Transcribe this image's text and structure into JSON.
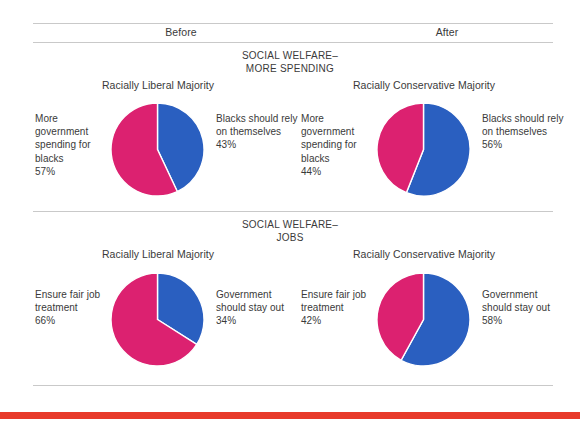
{
  "page": {
    "column_headers": {
      "before": "Before",
      "after": "After"
    },
    "accent_colors": {
      "magenta": "#dc2170",
      "blue": "#2a5fc0",
      "rule": "#c9c9c9",
      "bottom_bar": "#e83a2a",
      "text": "#3a3a3a"
    },
    "bottom_bar_label": "decorative-red-bar"
  },
  "sections": [
    {
      "title_line1": "SOCIAL WELFARE–",
      "title_line2": "MORE SPENDING",
      "panels": [
        {
          "heading": "Racially Liberal Majority",
          "left_label": "More government spending for blacks",
          "left_pct": "57%",
          "right_label": "Blacks should rely on themselves",
          "right_pct": "43%"
        },
        {
          "heading": "Racially Conservative Majority",
          "left_label": "More government spending for blacks",
          "left_pct": "44%",
          "right_label": "Blacks should rely on themselves",
          "right_pct": "56%"
        }
      ]
    },
    {
      "title_line1": "SOCIAL WELFARE–",
      "title_line2": "JOBS",
      "panels": [
        {
          "heading": "Racially Liberal Majority",
          "left_label": "Ensure fair job treatment",
          "left_pct": "66%",
          "right_label": "Government should stay out",
          "right_pct": "34%"
        },
        {
          "heading": "Racially Conservative Majority",
          "left_label": "Ensure fair job treatment",
          "left_pct": "42%",
          "right_label": "Government should stay out",
          "right_pct": "58%"
        }
      ]
    }
  ],
  "chart_data": [
    {
      "type": "pie",
      "title": "SOCIAL WELFARE–MORE SPENDING — Before — Racially Liberal Majority",
      "categories": [
        "More government spending for blacks",
        "Blacks should rely on themselves"
      ],
      "values": [
        57,
        43
      ],
      "colors": [
        "#dc2170",
        "#2a5fc0"
      ],
      "start_angle_deg": 0,
      "direction": "clockwise",
      "legend": "side-labels"
    },
    {
      "type": "pie",
      "title": "SOCIAL WELFARE–MORE SPENDING — After — Racially Conservative Majority",
      "categories": [
        "More government spending for blacks",
        "Blacks should rely on themselves"
      ],
      "values": [
        44,
        56
      ],
      "colors": [
        "#dc2170",
        "#2a5fc0"
      ],
      "start_angle_deg": 0,
      "direction": "clockwise",
      "legend": "side-labels"
    },
    {
      "type": "pie",
      "title": "SOCIAL WELFARE–JOBS — Before — Racially Liberal Majority",
      "categories": [
        "Ensure fair job treatment",
        "Government should stay out"
      ],
      "values": [
        66,
        34
      ],
      "colors": [
        "#dc2170",
        "#2a5fc0"
      ],
      "start_angle_deg": 0,
      "direction": "clockwise",
      "legend": "side-labels"
    },
    {
      "type": "pie",
      "title": "SOCIAL WELFARE–JOBS — After — Racially Conservative Majority",
      "categories": [
        "Ensure fair job treatment",
        "Government should stay out"
      ],
      "values": [
        42,
        58
      ],
      "colors": [
        "#dc2170",
        "#2a5fc0"
      ],
      "start_angle_deg": 0,
      "direction": "clockwise",
      "legend": "side-labels"
    }
  ]
}
